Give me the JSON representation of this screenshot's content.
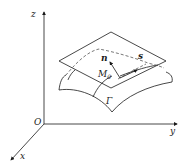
{
  "diagram": {
    "axes": {
      "z_label": "z",
      "y_label": "y",
      "x_label": "x",
      "origin_label": "O"
    },
    "labels": {
      "normal": "n",
      "tangent": "s",
      "point": "M",
      "point_sub": "0",
      "surface": "Γ"
    },
    "colors": {
      "stroke": "#1a1a1a",
      "dashed": "#555555",
      "background": "#ffffff"
    }
  }
}
